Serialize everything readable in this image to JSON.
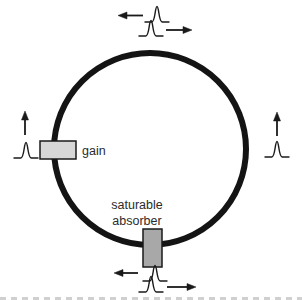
{
  "figure": {
    "kind": "ring-laser-cavity-diagram",
    "background": "#ffffff",
    "line_color": "#1a1a1a",
    "text_color": "#2b2b2b",
    "ring": {
      "stroke": "#141414",
      "stroke_width": 6
    },
    "components": {
      "gain": {
        "label": "gain",
        "fill": "#d7d7d7",
        "stroke": "#1a1a1a"
      },
      "saturable_absorber": {
        "label_line1": "saturable",
        "label_line2": "absorber",
        "fill": "#a8a8a8",
        "stroke": "#1a1a1a"
      }
    },
    "pulses": {
      "top_counterclockwise": {
        "icon": "pulse-icon",
        "arrow": "left"
      },
      "top_clockwise": {
        "icon": "pulse-icon",
        "arrow": "right"
      },
      "left_output": {
        "icon": "pulse-icon",
        "arrow": "up"
      },
      "right_output": {
        "icon": "pulse-icon",
        "arrow": "up"
      },
      "bottom_counterclockwise": {
        "icon": "pulse-icon",
        "arrow": "left"
      },
      "bottom_clockwise": {
        "icon": "pulse-icon",
        "arrow": "right"
      }
    }
  }
}
